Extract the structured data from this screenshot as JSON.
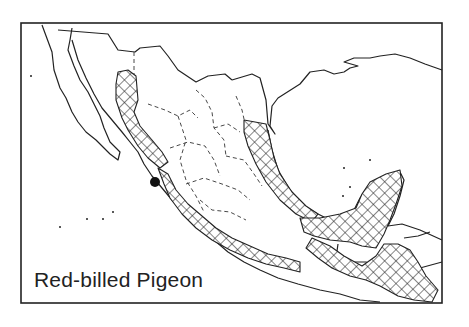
{
  "map": {
    "title": "Red-billed Pigeon",
    "legend": {
      "range_pattern": "crosshatch",
      "isolated_record": "black-dot"
    },
    "colors": {
      "line": "#222222",
      "background": "#ffffff"
    }
  }
}
